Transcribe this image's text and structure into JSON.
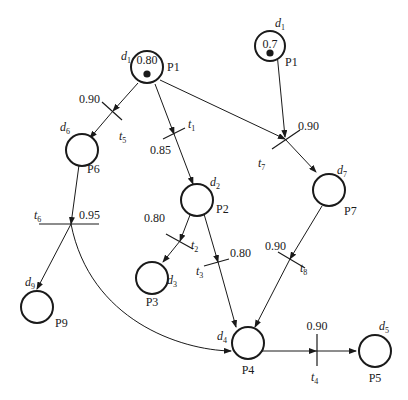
{
  "diagram": {
    "type": "fuzzy-petri-net",
    "places": [
      {
        "id": "P1",
        "label": "P1",
        "prop": "d",
        "sub": "1",
        "token": true,
        "certainty": "0.80"
      },
      {
        "id": "P1b",
        "label": "P1",
        "prop": "d",
        "sub": "1",
        "token": true,
        "certainty": "0.7"
      },
      {
        "id": "P2",
        "label": "P2",
        "prop": "d",
        "sub": "2",
        "token": false
      },
      {
        "id": "P3",
        "label": "P3",
        "prop": "d",
        "sub": "3",
        "token": false
      },
      {
        "id": "P4",
        "label": "P4",
        "prop": "d",
        "sub": "4",
        "token": false
      },
      {
        "id": "P5",
        "label": "P5",
        "prop": "d",
        "sub": "5",
        "token": false
      },
      {
        "id": "P6",
        "label": "P6",
        "prop": "d",
        "sub": "6",
        "token": false
      },
      {
        "id": "P7",
        "label": "P7",
        "prop": "d",
        "sub": "7",
        "token": false
      },
      {
        "id": "P9",
        "label": "P9",
        "prop": "d",
        "sub": "9",
        "token": false
      }
    ],
    "transitions": [
      {
        "id": "t1",
        "name": "t",
        "sub": "1",
        "cf": "0.85",
        "from": [
          "P1"
        ],
        "to": [
          "P2"
        ]
      },
      {
        "id": "t2",
        "name": "t",
        "sub": "2",
        "cf": "0.80",
        "from": [
          "P2"
        ],
        "to": [
          "P3"
        ]
      },
      {
        "id": "t3",
        "name": "t",
        "sub": "3",
        "cf": "0.80",
        "from": [
          "P2"
        ],
        "to": [
          "P4"
        ]
      },
      {
        "id": "t4",
        "name": "t",
        "sub": "4",
        "cf": "0.90",
        "from": [
          "P4"
        ],
        "to": [
          "P5"
        ]
      },
      {
        "id": "t5",
        "name": "t",
        "sub": "5",
        "cf": "0.90",
        "from": [
          "P1"
        ],
        "to": [
          "P6"
        ]
      },
      {
        "id": "t6",
        "name": "t",
        "sub": "6",
        "cf": "0.95",
        "from": [
          "P6"
        ],
        "to": [
          "P9",
          "P4"
        ]
      },
      {
        "id": "t7",
        "name": "t",
        "sub": "7",
        "cf": "0.90",
        "from": [
          "P1",
          "P1b"
        ],
        "to": [
          "P7"
        ]
      },
      {
        "id": "t8",
        "name": "t",
        "sub": "8",
        "cf": "0.90",
        "from": [
          "P7"
        ],
        "to": [
          "P4"
        ]
      }
    ]
  }
}
